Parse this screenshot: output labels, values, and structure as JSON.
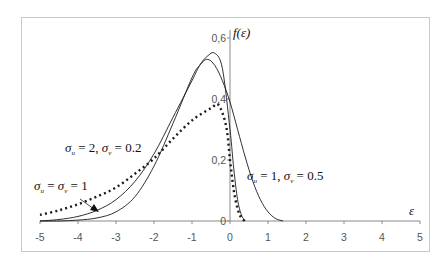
{
  "chart_data": {
    "type": "line",
    "title": "",
    "xlabel": "ε",
    "ylabel": "f(ε)",
    "xlim": [
      -5,
      5
    ],
    "ylim": [
      0,
      0.6
    ],
    "x_ticks": [
      "-5",
      "-4",
      "-3",
      "-2",
      "-1",
      "0",
      "1",
      "2",
      "3",
      "4",
      "5"
    ],
    "y_ticks": [
      "0",
      "0,2",
      "0,4",
      "0,6"
    ],
    "grid": false,
    "legend": "inline annotations",
    "series": [
      {
        "name": "σu = 2, σv = 0.2",
        "style": "dotted",
        "x": [
          -5,
          -4.5,
          -4,
          -3.5,
          -3,
          -2.5,
          -2,
          -1.5,
          -1,
          -0.5,
          -0.3,
          -0.1,
          0,
          0.1,
          0.2,
          0.3,
          0.4
        ],
        "y": [
          0.02,
          0.035,
          0.055,
          0.08,
          0.11,
          0.155,
          0.205,
          0.27,
          0.33,
          0.37,
          0.38,
          0.31,
          0.2,
          0.1,
          0.04,
          0.01,
          0
        ]
      },
      {
        "name": "σu = σv = 1",
        "style": "solid",
        "x": [
          -5,
          -4.5,
          -4,
          -3.5,
          -3,
          -2.5,
          -2,
          -1.5,
          -1,
          -0.8,
          -0.6,
          -0.4,
          -0.2,
          0,
          0.1,
          0.2,
          0.3,
          0.4
        ],
        "y": [
          0,
          0.005,
          0.015,
          0.035,
          0.07,
          0.13,
          0.22,
          0.34,
          0.46,
          0.51,
          0.54,
          0.55,
          0.5,
          0.3,
          0.17,
          0.07,
          0.02,
          0
        ]
      },
      {
        "name": "σu = 1, σv = 0.5",
        "style": "solid",
        "x": [
          -5,
          -4.5,
          -4,
          -3.5,
          -3,
          -2.5,
          -2,
          -1.5,
          -1,
          -0.8,
          -0.6,
          -0.4,
          -0.2,
          0,
          0.2,
          0.4,
          0.6,
          0.8,
          1,
          1.2,
          1.4
        ],
        "y": [
          0,
          0,
          0.003,
          0.01,
          0.03,
          0.08,
          0.18,
          0.32,
          0.47,
          0.51,
          0.53,
          0.51,
          0.46,
          0.39,
          0.3,
          0.21,
          0.13,
          0.07,
          0.03,
          0.008,
          0
        ]
      }
    ],
    "annotations": [
      {
        "text": "σu = 2, σv = 0.2",
        "x": -3.7,
        "y": 0.25
      },
      {
        "text": "σu = σv = 1",
        "x": -4.7,
        "y": 0.15,
        "arrow_to": [
          -3.5,
          0.03
        ]
      },
      {
        "text": "σu = 1, σv = 0.5",
        "x": 0.5,
        "y": 0.17
      }
    ]
  },
  "labels": {
    "y_axis_title": "f(ε)",
    "x_axis_title": "ε",
    "ann1": {
      "sym": "σ",
      "sub_u": "u",
      "eq1": " = 2, ",
      "sub_v": "v",
      "eq2": " = 0.2"
    },
    "ann2": {
      "sym": "σ",
      "sub_u": "u",
      "eq1": " = ",
      "sub_v": "v",
      "eq2": " = 1"
    },
    "ann3": {
      "sym": "σ",
      "sub_u": "u",
      "eq1": " = 1, ",
      "sub_v": "v",
      "eq2": " = 0.5"
    }
  }
}
